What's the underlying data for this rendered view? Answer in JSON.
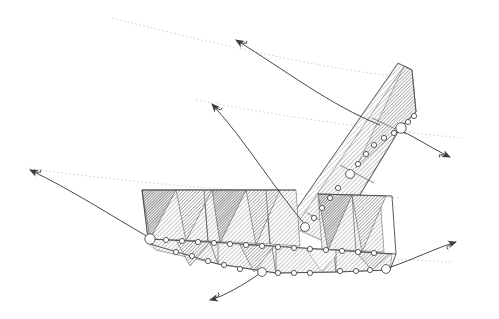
{
  "figure": {
    "background_color": "#ffffff",
    "width": 499,
    "height": 319
  },
  "style": {
    "stroke_color": "#3a3a3a",
    "edge_color": "#555555",
    "guide_color": "#c9c9c9",
    "arrow_color": "#444444",
    "marker_fill": "#ffffff",
    "marker_stroke": "#4a4a4a",
    "hatch_light": "#b9b9b9",
    "hatch_mid": "#8f8f8f",
    "hatch_dark": "#6a6a6a",
    "fill_light": "#d8d8d8",
    "fill_mid": "#b0b0b0",
    "fill_dark": "#8a8a8a"
  },
  "surface": {
    "name": "pleated-strip",
    "lower_band": {
      "label": "lower-pleated-band",
      "top_edge": [
        [
          142,
          190
        ],
        [
          205,
          190
        ],
        [
          268,
          190
        ],
        [
          330,
          192
        ],
        [
          392,
          196
        ]
      ],
      "ridge_edge": [
        [
          148,
          239
        ],
        [
          210,
          242
        ],
        [
          272,
          246
        ],
        [
          334,
          250
        ],
        [
          396,
          254
        ]
      ],
      "bottom_edge": [
        [
          152,
          248
        ],
        [
          215,
          262
        ],
        [
          262,
          272
        ],
        [
          325,
          272
        ],
        [
          388,
          270
        ]
      ],
      "pleat_count": 6
    },
    "upper_band": {
      "label": "upper-diagonal-band",
      "left_edge": [
        [
          296,
          226
        ],
        [
          342,
          160
        ],
        [
          388,
          96
        ],
        [
          404,
          70
        ]
      ],
      "right_edge": [
        [
          330,
          242
        ],
        [
          372,
          178
        ],
        [
          408,
          118
        ],
        [
          412,
          68
        ]
      ],
      "pleat_count": 3
    }
  },
  "markers": {
    "label": "vertex-circles",
    "large": [
      {
        "x": 150,
        "y": 239,
        "r": 6
      },
      {
        "x": 262,
        "y": 272,
        "r": 5
      },
      {
        "x": 384,
        "y": 270,
        "r": 5
      },
      {
        "x": 402,
        "y": 128,
        "r": 6
      },
      {
        "x": 350,
        "y": 174,
        "r": 5
      },
      {
        "x": 305,
        "y": 226,
        "r": 5
      }
    ],
    "small": [
      {
        "x": 166,
        "y": 240,
        "r": 3
      },
      {
        "x": 182,
        "y": 241,
        "r": 3
      },
      {
        "x": 198,
        "y": 242,
        "r": 3
      },
      {
        "x": 214,
        "y": 243,
        "r": 3
      },
      {
        "x": 230,
        "y": 244,
        "r": 3
      },
      {
        "x": 246,
        "y": 245,
        "r": 3
      },
      {
        "x": 262,
        "y": 246,
        "r": 3
      },
      {
        "x": 278,
        "y": 247,
        "r": 3
      },
      {
        "x": 294,
        "y": 248,
        "r": 3
      },
      {
        "x": 310,
        "y": 249,
        "r": 3
      },
      {
        "x": 326,
        "y": 250,
        "r": 3
      },
      {
        "x": 342,
        "y": 251,
        "r": 3
      },
      {
        "x": 358,
        "y": 252,
        "r": 3
      },
      {
        "x": 374,
        "y": 253,
        "r": 3
      },
      {
        "x": 176,
        "y": 252,
        "r": 3
      },
      {
        "x": 192,
        "y": 256,
        "r": 3
      },
      {
        "x": 208,
        "y": 260,
        "r": 3
      },
      {
        "x": 224,
        "y": 265,
        "r": 3
      },
      {
        "x": 240,
        "y": 269,
        "r": 3
      },
      {
        "x": 278,
        "y": 273,
        "r": 3
      },
      {
        "x": 294,
        "y": 273,
        "r": 3
      },
      {
        "x": 310,
        "y": 273,
        "r": 3
      },
      {
        "x": 340,
        "y": 271,
        "r": 3
      },
      {
        "x": 356,
        "y": 271,
        "r": 3
      },
      {
        "x": 370,
        "y": 270,
        "r": 3
      },
      {
        "x": 314,
        "y": 218,
        "r": 3
      },
      {
        "x": 322,
        "y": 208,
        "r": 3
      },
      {
        "x": 330,
        "y": 198,
        "r": 3
      },
      {
        "x": 338,
        "y": 188,
        "r": 3
      },
      {
        "x": 344,
        "y": 182,
        "r": 3
      },
      {
        "x": 358,
        "y": 164,
        "r": 3
      },
      {
        "x": 366,
        "y": 154,
        "r": 3
      },
      {
        "x": 374,
        "y": 145,
        "r": 3
      },
      {
        "x": 382,
        "y": 138,
        "r": 3
      },
      {
        "x": 392,
        "y": 132,
        "r": 3
      },
      {
        "x": 408,
        "y": 122,
        "r": 3
      },
      {
        "x": 406,
        "y": 118,
        "r": 3
      }
    ]
  },
  "arrows": [
    {
      "id": "arrow-top-left",
      "label": "flow-arrow-1",
      "path": "M 380 125 C 330 105 285 70 236 40",
      "tip": [
        228,
        38
      ],
      "angle": 200
    },
    {
      "id": "arrow-mid-left",
      "label": "flow-arrow-2",
      "path": "M 308 228 C 275 190 245 140 212 104",
      "tip": [
        204,
        102
      ],
      "angle": 205
    },
    {
      "id": "arrow-far-left",
      "label": "flow-arrow-3",
      "path": "M 150 238 C 110 215 72 190 30 170",
      "tip": [
        22,
        168
      ],
      "angle": 200
    },
    {
      "id": "arrow-right-upper",
      "label": "flow-arrow-4",
      "path": "M 400 130 C 420 140 435 150 450 157",
      "tip": [
        455,
        158
      ],
      "angle": 20
    },
    {
      "id": "arrow-right-lower",
      "label": "flow-arrow-5",
      "path": "M 388 268 C 412 260 435 248 456 242",
      "tip": [
        462,
        241
      ],
      "angle": -15
    },
    {
      "id": "arrow-bottom",
      "label": "flow-arrow-6",
      "path": "M 262 272 C 240 286 222 296 208 300",
      "tip": [
        203,
        301
      ],
      "angle": 160
    }
  ],
  "guides": [
    {
      "id": "guide-1",
      "label": "dotted-guide-upper",
      "path": "M 112 18 C 230 48 340 72 412 78"
    },
    {
      "id": "guide-2",
      "label": "dotted-guide-middle",
      "path": "M 196 100 C 300 120 400 132 462 138"
    },
    {
      "id": "guide-3",
      "label": "dotted-guide-lower",
      "path": "M 26 168 C 150 186 300 196 400 198"
    },
    {
      "id": "guide-4",
      "label": "dotted-guide-bottom",
      "path": "M 150 238 C 250 250 360 258 452 262"
    }
  ],
  "legend": {
    "shown": false,
    "items": []
  }
}
